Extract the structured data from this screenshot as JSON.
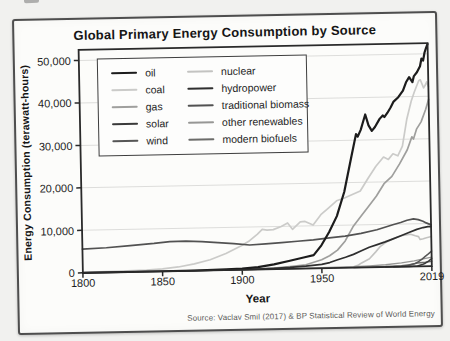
{
  "chart_data": {
    "type": "line",
    "title": "Global Primary Energy Consumption by Source",
    "xlabel": "Year",
    "ylabel": "Energy Consumption (terawatt-hours)",
    "source": "Source: Vaclav Smil (2017) & BP Statistical Review of World Energy",
    "xlim": [
      1800,
      2019
    ],
    "ylim": [
      0,
      52500
    ],
    "grid": "horizontal",
    "legend_position": "inside-top-left",
    "xticks": {
      "values": [
        1800,
        1850,
        1900,
        1950,
        2019
      ],
      "labels": [
        "1800",
        "1850",
        "1900",
        "1950",
        "2019"
      ]
    },
    "yticks": {
      "values": [
        0,
        10000,
        20000,
        30000,
        40000,
        50000
      ],
      "labels": [
        "0",
        "10,000",
        "20,000",
        "30,000",
        "40,000",
        "50,000"
      ]
    },
    "series": [
      {
        "name": "oil",
        "color": "#1c1c1c",
        "stroke_width": 2.2,
        "points": [
          [
            1800,
            0
          ],
          [
            1850,
            5
          ],
          [
            1870,
            30
          ],
          [
            1890,
            150
          ],
          [
            1900,
            270
          ],
          [
            1910,
            550
          ],
          [
            1920,
            1100
          ],
          [
            1930,
            1900
          ],
          [
            1940,
            2700
          ],
          [
            1945,
            3100
          ],
          [
            1950,
            5400
          ],
          [
            1955,
            8500
          ],
          [
            1960,
            12200
          ],
          [
            1965,
            17900
          ],
          [
            1970,
            26400
          ],
          [
            1973,
            31400
          ],
          [
            1974,
            30800
          ],
          [
            1976,
            32400
          ],
          [
            1977,
            33600
          ],
          [
            1979,
            36000
          ],
          [
            1981,
            33400
          ],
          [
            1983,
            32100
          ],
          [
            1985,
            33000
          ],
          [
            1988,
            34900
          ],
          [
            1990,
            35700
          ],
          [
            1991,
            35300
          ],
          [
            1993,
            36300
          ],
          [
            1995,
            37500
          ],
          [
            1997,
            38900
          ],
          [
            2000,
            39900
          ],
          [
            2003,
            41400
          ],
          [
            2005,
            43400
          ],
          [
            2007,
            44600
          ],
          [
            2009,
            43400
          ],
          [
            2010,
            44800
          ],
          [
            2012,
            45700
          ],
          [
            2014,
            47100
          ],
          [
            2015,
            48900
          ],
          [
            2016,
            48400
          ],
          [
            2017,
            50300
          ],
          [
            2018,
            51400
          ],
          [
            2019,
            52300
          ]
        ]
      },
      {
        "name": "coal",
        "color": "#cbcbc9",
        "stroke_width": 1.7,
        "points": [
          [
            1800,
            100
          ],
          [
            1820,
            180
          ],
          [
            1840,
            350
          ],
          [
            1850,
            570
          ],
          [
            1860,
            950
          ],
          [
            1870,
            1600
          ],
          [
            1880,
            2500
          ],
          [
            1890,
            3900
          ],
          [
            1900,
            5700
          ],
          [
            1905,
            6800
          ],
          [
            1910,
            8300
          ],
          [
            1913,
            9400
          ],
          [
            1916,
            9200
          ],
          [
            1920,
            9300
          ],
          [
            1925,
            10000
          ],
          [
            1929,
            10800
          ],
          [
            1932,
            9300
          ],
          [
            1937,
            11000
          ],
          [
            1940,
            11100
          ],
          [
            1945,
            10200
          ],
          [
            1950,
            12600
          ],
          [
            1955,
            14200
          ],
          [
            1960,
            15800
          ],
          [
            1965,
            16400
          ],
          [
            1970,
            17200
          ],
          [
            1975,
            18000
          ],
          [
            1980,
            20900
          ],
          [
            1985,
            23700
          ],
          [
            1990,
            25900
          ],
          [
            1993,
            25300
          ],
          [
            1996,
            26600
          ],
          [
            1999,
            26100
          ],
          [
            2002,
            28400
          ],
          [
            2005,
            34600
          ],
          [
            2008,
            38900
          ],
          [
            2010,
            41000
          ],
          [
            2013,
            43700
          ],
          [
            2014,
            43900
          ],
          [
            2016,
            42000
          ],
          [
            2017,
            42600
          ],
          [
            2018,
            43400
          ],
          [
            2019,
            42300
          ]
        ]
      },
      {
        "name": "gas",
        "color": "#9f9f9d",
        "stroke_width": 1.7,
        "points": [
          [
            1885,
            10
          ],
          [
            1900,
            64
          ],
          [
            1910,
            140
          ],
          [
            1920,
            230
          ],
          [
            1930,
            510
          ],
          [
            1940,
            870
          ],
          [
            1950,
            2000
          ],
          [
            1955,
            2900
          ],
          [
            1960,
            4200
          ],
          [
            1965,
            6300
          ],
          [
            1970,
            9600
          ],
          [
            1975,
            12000
          ],
          [
            1980,
            14300
          ],
          [
            1985,
            16700
          ],
          [
            1990,
            19600
          ],
          [
            1995,
            21300
          ],
          [
            2000,
            24200
          ],
          [
            2005,
            27500
          ],
          [
            2008,
            30500
          ],
          [
            2009,
            30000
          ],
          [
            2011,
            32300
          ],
          [
            2014,
            34000
          ],
          [
            2017,
            36900
          ],
          [
            2019,
            39300
          ]
        ]
      },
      {
        "name": "solar",
        "color": "#3a3a3a",
        "stroke_width": 1.5,
        "points": [
          [
            1995,
            1
          ],
          [
            2005,
            10
          ],
          [
            2010,
            100
          ],
          [
            2013,
            400
          ],
          [
            2015,
            700
          ],
          [
            2017,
            1200
          ],
          [
            2019,
            1800
          ]
        ]
      },
      {
        "name": "wind",
        "color": "#565656",
        "stroke_width": 1.5,
        "points": [
          [
            1990,
            10
          ],
          [
            1998,
            60
          ],
          [
            2000,
            90
          ],
          [
            2004,
            230
          ],
          [
            2008,
            620
          ],
          [
            2010,
            960
          ],
          [
            2013,
            1700
          ],
          [
            2015,
            2300
          ],
          [
            2017,
            2900
          ],
          [
            2019,
            3540
          ]
        ]
      },
      {
        "name": "nuclear",
        "color": "#c3c3c1",
        "stroke_width": 1.6,
        "points": [
          [
            1958,
            5
          ],
          [
            1965,
            70
          ],
          [
            1970,
            220
          ],
          [
            1973,
            580
          ],
          [
            1975,
            1050
          ],
          [
            1980,
            2000
          ],
          [
            1984,
            3600
          ],
          [
            1987,
            4900
          ],
          [
            1990,
            5700
          ],
          [
            1995,
            6600
          ],
          [
            2000,
            7300
          ],
          [
            2004,
            7500
          ],
          [
            2006,
            7600
          ],
          [
            2009,
            7200
          ],
          [
            2011,
            7000
          ],
          [
            2012,
            6300
          ],
          [
            2014,
            6500
          ],
          [
            2016,
            6700
          ],
          [
            2019,
            7000
          ]
        ]
      },
      {
        "name": "hydropower",
        "color": "#2f2f2f",
        "stroke_width": 1.7,
        "points": [
          [
            1890,
            20
          ],
          [
            1900,
            47
          ],
          [
            1910,
            100
          ],
          [
            1920,
            190
          ],
          [
            1930,
            340
          ],
          [
            1940,
            560
          ],
          [
            1950,
            890
          ],
          [
            1955,
            1300
          ],
          [
            1960,
            1900
          ],
          [
            1965,
            2480
          ],
          [
            1970,
            3100
          ],
          [
            1975,
            3900
          ],
          [
            1980,
            4700
          ],
          [
            1985,
            5300
          ],
          [
            1990,
            5900
          ],
          [
            1995,
            6600
          ],
          [
            2000,
            7300
          ],
          [
            2005,
            8000
          ],
          [
            2010,
            8700
          ],
          [
            2014,
            9100
          ],
          [
            2017,
            9300
          ],
          [
            2019,
            9300
          ]
        ]
      },
      {
        "name": "traditional biomass",
        "color": "#525252",
        "stroke_width": 1.7,
        "points": [
          [
            1800,
            5550
          ],
          [
            1815,
            5800
          ],
          [
            1830,
            6200
          ],
          [
            1845,
            6600
          ],
          [
            1855,
            6950
          ],
          [
            1865,
            7000
          ],
          [
            1875,
            6800
          ],
          [
            1885,
            6500
          ],
          [
            1895,
            6200
          ],
          [
            1905,
            5800
          ],
          [
            1915,
            6000
          ],
          [
            1925,
            6200
          ],
          [
            1935,
            6450
          ],
          [
            1945,
            6700
          ],
          [
            1955,
            7100
          ],
          [
            1965,
            7450
          ],
          [
            1975,
            8000
          ],
          [
            1985,
            8800
          ],
          [
            1995,
            9900
          ],
          [
            2000,
            10400
          ],
          [
            2004,
            10900
          ],
          [
            2008,
            11200
          ],
          [
            2011,
            11000
          ],
          [
            2014,
            10600
          ],
          [
            2016,
            10200
          ],
          [
            2019,
            9700
          ]
        ]
      },
      {
        "name": "other renewables",
        "color": "#979795",
        "stroke_width": 1.4,
        "points": [
          [
            1900,
            5
          ],
          [
            1930,
            30
          ],
          [
            1950,
            90
          ],
          [
            1960,
            130
          ],
          [
            1970,
            200
          ],
          [
            1980,
            320
          ],
          [
            1990,
            520
          ],
          [
            2000,
            900
          ],
          [
            2008,
            1300
          ],
          [
            2013,
            1700
          ],
          [
            2019,
            2130
          ]
        ]
      },
      {
        "name": "modern biofuels",
        "color": "#6c6c6a",
        "stroke_width": 1.4,
        "points": [
          [
            1970,
            20
          ],
          [
            1980,
            60
          ],
          [
            1990,
            120
          ],
          [
            2000,
            260
          ],
          [
            2005,
            420
          ],
          [
            2010,
            780
          ],
          [
            2015,
            950
          ],
          [
            2019,
            1140
          ]
        ]
      }
    ]
  }
}
